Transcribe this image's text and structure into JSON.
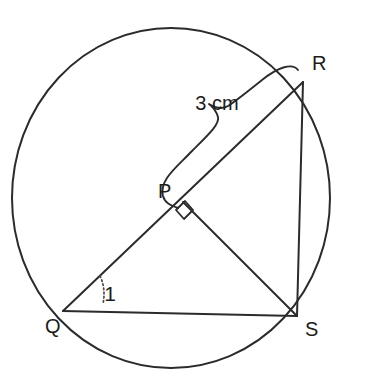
{
  "figure": {
    "kind": "circle-geometry-diagram",
    "background_color": "#ffffff",
    "stroke_color": "#2b2b2b",
    "width": 365,
    "height": 388
  },
  "circle": {
    "name": "circumscribed-circle",
    "center_x": 171,
    "center_y": 198,
    "radius_x": 159,
    "radius_y": 170
  },
  "points": {
    "Q": {
      "label": "Q",
      "x": 63,
      "y": 311,
      "label_x": 45,
      "label_y": 333
    },
    "R": {
      "label": "R",
      "x": 303,
      "y": 82,
      "label_x": 312,
      "label_y": 70
    },
    "S": {
      "label": "S",
      "x": 297,
      "y": 316,
      "label_x": 305,
      "label_y": 336
    },
    "P": {
      "label": "P",
      "x": 183,
      "y": 202,
      "label_x": 158,
      "label_y": 198
    }
  },
  "segments": [
    {
      "name": "segment-QR",
      "from": "Q",
      "to": "R",
      "x1": 63,
      "y1": 311,
      "x2": 303,
      "y2": 82
    },
    {
      "name": "segment-QS",
      "from": "Q",
      "to": "S",
      "x1": 63,
      "y1": 311,
      "x2": 297,
      "y2": 316
    },
    {
      "name": "segment-RS",
      "from": "R",
      "to": "S",
      "x1": 303,
      "y1": 82,
      "x2": 297,
      "y2": 316
    },
    {
      "name": "segment-PS",
      "from": "P",
      "to": "S",
      "x1": 183,
      "y1": 202,
      "x2": 297,
      "y2": 316
    }
  ],
  "annotations": {
    "measure_label": "3 cm",
    "measure_label_x": 217,
    "measure_label_y": 110,
    "measure_of_segment": "PR",
    "angle_label": "1",
    "angle_label_x": 110,
    "angle_label_y": 301,
    "angle_at_vertex": "Q",
    "right_angle_at": "P",
    "right_angle_marker": "square"
  },
  "paths": {
    "brace_PR": "M 178 208 C 170 205, 165 203, 163 196 C 159 180, 176 168, 192 151 C 208 135, 220 124, 218 117 C 216 110, 213 107, 209 104 C 216 108, 222 110, 228 106 C 236 101, 247 92, 262 80 C 277 68, 292 62, 298 70",
    "right_angle_square": "M 176 210 L 184 219 L 193 210 L 185 201 Z",
    "angle_arc_1": "M 100 276 C 104 284, 105 294, 103 304"
  }
}
